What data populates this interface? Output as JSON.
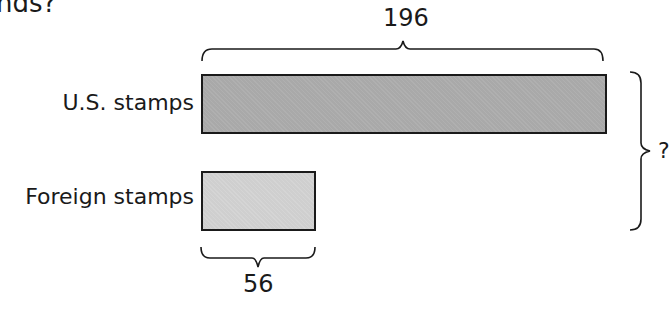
{
  "header": {
    "partial_text": "nds?"
  },
  "diagram": {
    "type": "bar-model",
    "bars": [
      {
        "label": "U.S. stamps",
        "value": 196,
        "value_label": "196",
        "color": "#a9a9a9"
      },
      {
        "label": "Foreign stamps",
        "value": 56,
        "value_label": "56",
        "color": "#cfcfcf"
      }
    ],
    "total_label": "?"
  }
}
